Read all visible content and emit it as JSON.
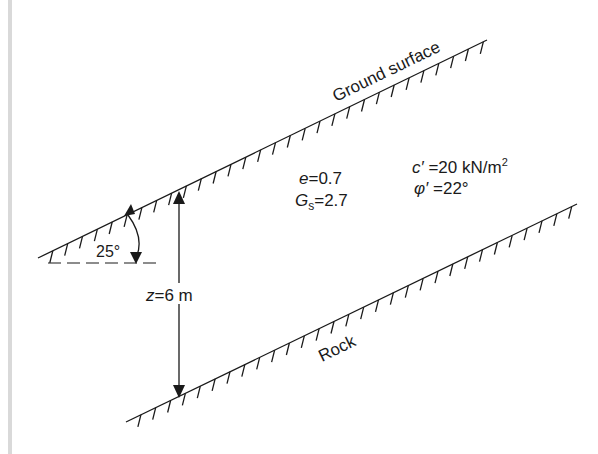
{
  "diagram": {
    "type": "infinite-slope",
    "labels": {
      "ground_surface": "Ground surface",
      "rock": "Rock",
      "angle": "25°",
      "depth_var": "z",
      "depth_eq": "=6 m",
      "void_ratio_var": "e",
      "void_ratio_eq": "=0.7",
      "gs_var": "G",
      "gs_sub": "s",
      "gs_eq": "=2.7",
      "cohesion_var": "c′",
      "cohesion_eq": " =20 kN/m",
      "cohesion_sup": "2",
      "friction_var": "φ′",
      "friction_eq": " =22°"
    },
    "parameters": {
      "slope_angle_deg": 25,
      "depth_m": 6,
      "void_ratio": 0.7,
      "specific_gravity": 2.7,
      "cohesion_kN_per_m2": 20,
      "friction_angle_deg": 22
    },
    "colors": {
      "line": "#1a1a1a",
      "margin_bar": "#d9d9d9"
    }
  }
}
